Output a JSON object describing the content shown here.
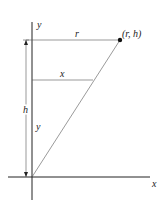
{
  "diagram": {
    "type": "cone-cross-section",
    "axes": {
      "x_label": "x",
      "y_label": "y"
    },
    "labels": {
      "top_segment": "r",
      "point": "(r, h)",
      "mid_segment": "x",
      "height": "h",
      "mid_height": "y"
    },
    "colors": {
      "line": "#222222",
      "background": "#ffffff"
    }
  }
}
